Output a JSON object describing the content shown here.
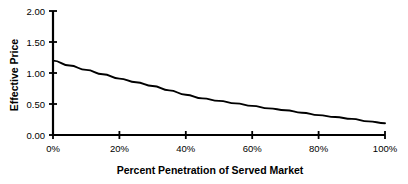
{
  "chart_data": {
    "type": "line",
    "title": "",
    "xlabel": "Percent Penetration of Served Market",
    "ylabel": "Effective Price",
    "xlim": [
      0,
      100
    ],
    "ylim": [
      0.0,
      2.0
    ],
    "grid": false,
    "legend": "none",
    "x_tick_labels": [
      "0%",
      "20%",
      "40%",
      "60%",
      "80%",
      "100%"
    ],
    "x_tick_values": [
      0,
      20,
      40,
      60,
      80,
      100
    ],
    "y_tick_labels": [
      "0.00",
      "0.50",
      "1.00",
      "1.50",
      "2.00"
    ],
    "y_tick_values": [
      0.0,
      0.5,
      1.0,
      1.5,
      2.0
    ],
    "series": [
      {
        "name": "Effective Price",
        "color": "#000000",
        "x": [
          0,
          5,
          10,
          15,
          20,
          25,
          30,
          35,
          40,
          45,
          50,
          55,
          60,
          65,
          70,
          75,
          80,
          85,
          90,
          95,
          100
        ],
        "values": [
          1.2,
          1.12,
          1.05,
          0.98,
          0.91,
          0.85,
          0.79,
          0.72,
          0.65,
          0.59,
          0.55,
          0.51,
          0.47,
          0.43,
          0.4,
          0.36,
          0.32,
          0.29,
          0.26,
          0.22,
          0.19
        ]
      }
    ]
  }
}
